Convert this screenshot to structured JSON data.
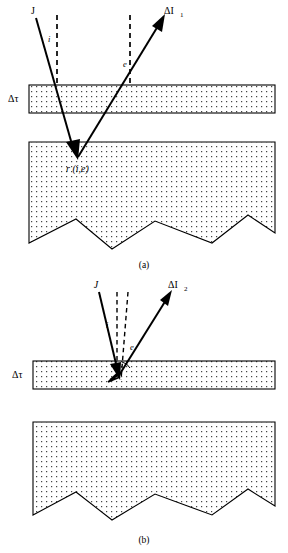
{
  "figure": {
    "panels": [
      {
        "id": "a",
        "caption": "(a)",
        "layer_label": "Δτ",
        "incident_label": "J",
        "emergent_label": "ΔI",
        "emergent_subscript": "1",
        "incidence_angle_label": "i",
        "emergence_angle_label": "e",
        "scatter_label": "r (i,e)",
        "description": "Incident ray J passes through thin layer, reflects off rough surface at r(i,e), exits as ΔI₁"
      },
      {
        "id": "b",
        "caption": "(b)",
        "layer_label": "Δτ",
        "incident_label": "J",
        "emergent_label": "ΔI",
        "emergent_subscript": "2",
        "incidence_angle_label": "i",
        "emergence_angle_label": "e",
        "description": "Incident ray J scatters within the thin layer and exits as ΔI₂"
      }
    ],
    "colors": {
      "line": "#000000",
      "fill": "#ffffff",
      "stipple": "#000000",
      "background": "#ffffff"
    },
    "symbols": {
      "delta": "Δ",
      "tau": "τ"
    }
  }
}
